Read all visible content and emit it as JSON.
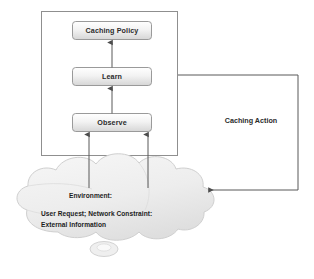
{
  "diagram": {
    "colors": {
      "box_fill_top": "#fdfdfd",
      "box_fill_bottom": "#d9d9d9",
      "box_border": "#9a9a9a",
      "outer_border": "#8f8f8f",
      "connector": "#595959",
      "cloud_fill": "#eeeeee",
      "cloud_border": "#cfcfcf",
      "text": "#2b2b2b"
    },
    "nodes": [
      {
        "id": "caching-policy",
        "label": "Caching Policy",
        "shape": "rounded-rect"
      },
      {
        "id": "learn",
        "label": "Learn",
        "shape": "rounded-rect"
      },
      {
        "id": "observe",
        "label": "Observe",
        "shape": "rounded-rect"
      }
    ],
    "edge_labels": [
      {
        "id": "caching-action",
        "label": "Caching Action"
      }
    ],
    "cloud": {
      "id": "environment-cloud",
      "lines": [
        "Environment:",
        "User Request; Network Constraint:",
        "External Information"
      ]
    },
    "connections": [
      {
        "from": "observe",
        "to": "learn",
        "arrow": true
      },
      {
        "from": "learn",
        "to": "caching-policy",
        "arrow": true
      },
      {
        "from": "environment-cloud",
        "to": "observe",
        "arrow": true,
        "count": 2
      },
      {
        "from": "agent-boundary",
        "to": "environment-cloud",
        "arrow": true,
        "label": "Caching Action"
      }
    ]
  }
}
